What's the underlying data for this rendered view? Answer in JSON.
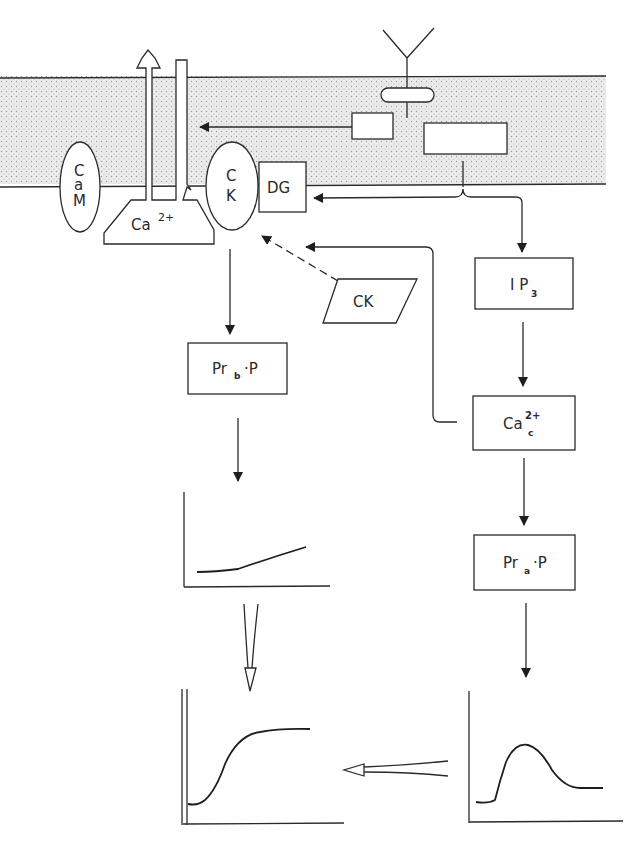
{
  "diagram": {
    "membrane": {
      "fill": "#e6e6e6",
      "dot_color": "#9a9a9a"
    },
    "nodes": {
      "calmodulin": {
        "line1": "C",
        "line2": "a",
        "line3": "M"
      },
      "calcium_channel": {
        "base": "Ca",
        "sup": "2+"
      },
      "c_kinase_membrane": {
        "line1": "C",
        "line2": "K"
      },
      "diacylglycerol": {
        "label": "DG"
      },
      "c_kinase_cytosol": {
        "label": "CK"
      },
      "ip3": {
        "base": "I P",
        "sub": "3"
      },
      "ca_cytosolic": {
        "base": "Ca",
        "sup": "2+",
        "sub": "c"
      },
      "pr_b_p": {
        "base": "Pr",
        "sub": "b",
        "tail": "·P"
      },
      "pr_a_p": {
        "base": "Pr",
        "sub": "a",
        "tail": "·P"
      }
    },
    "graphs": [
      {
        "id": "sustained-phase-small",
        "shape": "slow-rise"
      },
      {
        "id": "combined-response",
        "shape": "sigmoid-plateau"
      },
      {
        "id": "initial-phase",
        "shape": "transient-peak"
      }
    ]
  }
}
